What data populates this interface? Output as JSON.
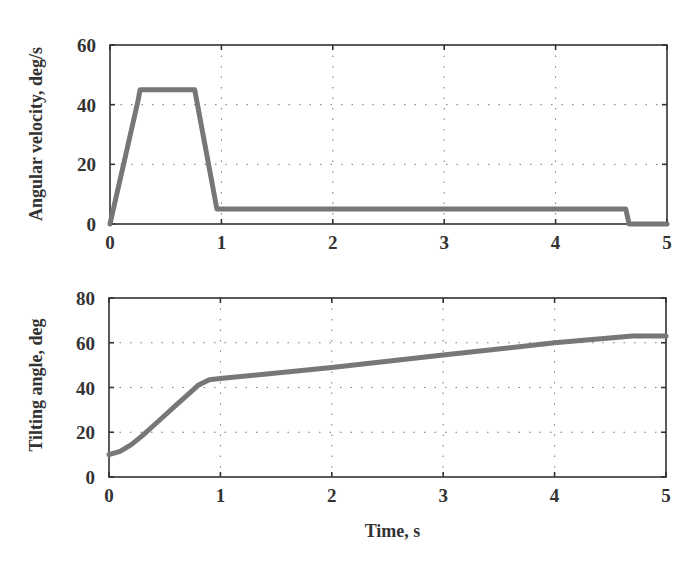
{
  "chart_data": [
    {
      "type": "line",
      "title": "",
      "xlabel": "",
      "ylabel": "Angular velocity, deg/s",
      "xlim": [
        0,
        5
      ],
      "ylim": [
        0,
        60
      ],
      "xticks": [
        "0",
        "1",
        "2",
        "3",
        "4",
        "5"
      ],
      "yticks": [
        "0",
        "20",
        "40",
        "60"
      ],
      "grid": true,
      "series": [
        {
          "name": "Angular velocity",
          "color": "#777777",
          "x": [
            0,
            0.25,
            0.27,
            0.76,
            0.96,
            4.63,
            4.66,
            5.0
          ],
          "y": [
            0,
            41,
            45,
            45,
            5,
            5,
            0,
            0
          ]
        }
      ]
    },
    {
      "type": "line",
      "title": "",
      "xlabel": "Time, s",
      "ylabel": "Tilting angle, deg",
      "xlim": [
        0,
        5
      ],
      "ylim": [
        0,
        80
      ],
      "xticks": [
        "0",
        "1",
        "2",
        "3",
        "4",
        "5"
      ],
      "yticks": [
        "0",
        "20",
        "40",
        "60",
        "80"
      ],
      "grid": true,
      "series": [
        {
          "name": "Tilting angle",
          "color": "#777777",
          "x": [
            0,
            0.1,
            0.2,
            0.3,
            0.4,
            0.5,
            0.6,
            0.7,
            0.8,
            0.9,
            1.0,
            2.0,
            3.0,
            4.0,
            4.7,
            5.0
          ],
          "y": [
            10,
            11.5,
            14.5,
            18.5,
            23,
            27.5,
            32,
            36.5,
            41,
            43.5,
            44,
            49,
            54.5,
            60,
            63,
            63
          ]
        }
      ]
    }
  ]
}
